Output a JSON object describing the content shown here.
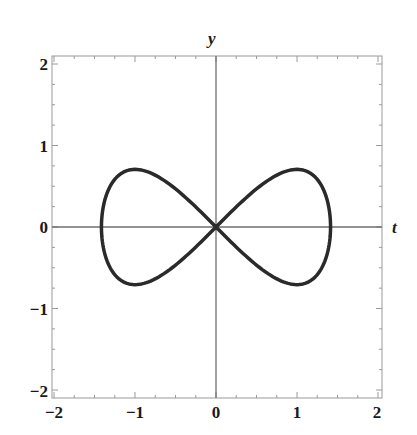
{
  "chart_data": {
    "type": "line",
    "title": "",
    "xlabel": "t",
    "ylabel": "y",
    "xlim": [
      -2,
      2
    ],
    "ylim": [
      -2,
      2
    ],
    "grid": false,
    "frame": true,
    "axes_through_origin": true,
    "x_ticks": [
      "-2",
      "-1",
      "0",
      "1",
      "2"
    ],
    "y_ticks": [
      "2",
      "1",
      "0",
      "-1",
      "-2"
    ],
    "minor_ticks_per_unit": 4,
    "key_points": [
      {
        "x": 0,
        "y": 0,
        "note": "self-intersection at origin"
      },
      {
        "x": 1.41,
        "y": 0,
        "note": "rightmost point"
      },
      {
        "x": -1.41,
        "y": 0,
        "note": "leftmost point"
      },
      {
        "x": 1.0,
        "y": 0.71,
        "note": "upper-right peak"
      },
      {
        "x": -1.0,
        "y": 0.71,
        "note": "upper-left peak"
      },
      {
        "x": 1.0,
        "y": -0.71,
        "note": "lower-right trough"
      },
      {
        "x": -1.0,
        "y": -0.71,
        "note": "lower-left trough"
      }
    ],
    "series": [
      {
        "name": "curve",
        "color": "#2a2a2a",
        "line_width": 3.5,
        "closed": true,
        "param": {
          "x": "sqrt(2)*cos(s)",
          "y": "sin(2*s)/sqrt(2)",
          "s_range": [
            0,
            6.2832
          ],
          "samples": 240
        }
      }
    ]
  },
  "labels": {
    "x_axis": "t",
    "y_axis": "y",
    "x_ticks": [
      "−2",
      "−1",
      "0",
      "1",
      "2"
    ],
    "y_ticks": [
      "2",
      "1",
      "0",
      "−1",
      "−2"
    ]
  },
  "colors": {
    "frame": "#9a9a9a",
    "axis": "#6e6e6e",
    "curve": "#2a2a2a",
    "text": "#1a1a1a"
  }
}
